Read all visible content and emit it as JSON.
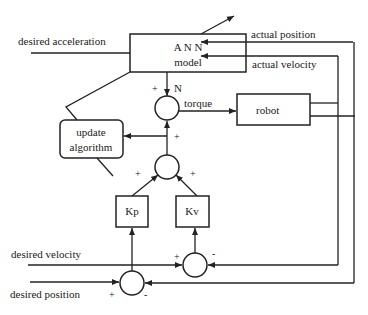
{
  "diagram": {
    "inputs": {
      "desired_acceleration": "desired acceleration",
      "desired_velocity": "desired velocity",
      "desired_position": "desired position"
    },
    "feedback": {
      "actual_position": "actual position",
      "actual_velocity": "actual velocity"
    },
    "blocks": {
      "ann_line1": "A N N",
      "ann_line2": "model",
      "update_line1": "update",
      "update_line2": "algorithm",
      "robot": "robot",
      "kp": "Kp",
      "kv": "Kv"
    },
    "signals": {
      "torque": "torque",
      "n": "N"
    },
    "signs": {
      "plus": "+",
      "minus": "-"
    }
  }
}
